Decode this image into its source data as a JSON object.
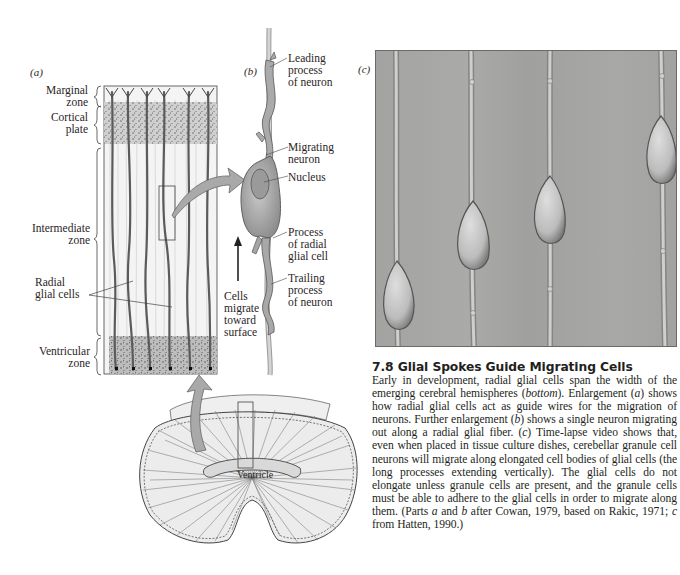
{
  "figure": {
    "number": "7.8",
    "title": "7.8  Glial Spokes Guide Migrating Cells",
    "panels": {
      "a": {
        "tag": "a",
        "zone_labels": [
          {
            "line1": "Marginal",
            "line2": "zone"
          },
          {
            "line1": "Cortical",
            "line2": "plate"
          },
          {
            "line1": "Intermediate",
            "line2": "zone"
          },
          {
            "line1": "Ventricular",
            "line2": "zone"
          }
        ],
        "radial_glial_label": {
          "line1": "Radial",
          "line2": "glial cells"
        }
      },
      "b": {
        "tag": "b",
        "labels": [
          {
            "line1": "Leading",
            "line2": "process",
            "line3": "of neuron"
          },
          {
            "line1": "Migrating",
            "line2": "neuron"
          },
          {
            "line1": "Nucleus"
          },
          {
            "line1": "Process",
            "line2": "of radial",
            "line3": "glial cell"
          },
          {
            "line1": "Trailing",
            "line2": "process",
            "line3": "of neuron"
          }
        ],
        "migration_note": {
          "line1": "Cells",
          "line2": "migrate",
          "line3": "toward",
          "line4": "surface"
        }
      },
      "c": {
        "tag": "c",
        "description": "Time-lapse micrograph of four granule neurons on vertical glial fibers"
      },
      "bottom": {
        "ventricle_label": "Ventricle"
      }
    },
    "caption": {
      "s1": "Early in development, radial glial cells span the width of the emerging cerebral hemispheres (",
      "s1_italic": "bottom",
      "s2": "). Enlarge­ment (",
      "s2_italic": "a",
      "s3": ") shows how radial glial cells act as guide wires for the migration of neurons. Further enlargement (",
      "s3_italic": "b",
      "s4": ") shows a single neuron migrating out along a radial glial fiber. (",
      "s4_italic": "c",
      "s5": ") Time-lapse video shows that, even when placed in tissue culture dishes, cerebellar granule cell neurons will migrate along elongated cell bodies of glial cells (the long processes extending vertically). The glial cells do not elongate unless granule cells are present, and the granule cells must be able to adhere to the glial cells in order to migrate along them. (Parts ",
      "s5_italic": "a",
      "s6": " and ",
      "s6_italic": "b",
      "s7": " after Cowan, 1979, based on Rakic, 1971; ",
      "s7_italic": "c",
      "s8": " from Hatten, 1990.)"
    }
  },
  "colors": {
    "ink": "#231f20",
    "arrow_fill": "#a9a9a9",
    "neuron_fill": "#b5b5b5",
    "photo_bg": "#a7a7a5",
    "stipple_bg": "#c8c8c8"
  }
}
